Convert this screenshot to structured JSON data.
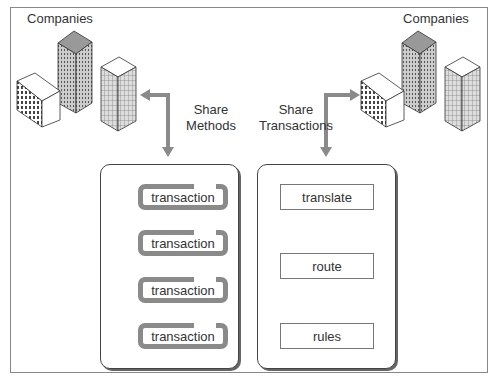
{
  "diagram": {
    "left_group": {
      "label": "Companies"
    },
    "right_group": {
      "label": "Companies"
    },
    "left_connector": {
      "label_line1": "Share",
      "label_line2": "Methods"
    },
    "right_connector": {
      "label_line1": "Share",
      "label_line2": "Transactions"
    },
    "left_panel": {
      "items": [
        {
          "label": "transaction"
        },
        {
          "label": "transaction"
        },
        {
          "label": "transaction"
        },
        {
          "label": "transaction"
        }
      ]
    },
    "right_panel": {
      "items": [
        {
          "label": "translate"
        },
        {
          "label": "route"
        },
        {
          "label": "rules"
        }
      ]
    },
    "colors": {
      "arrow": "#8a8a8a",
      "border": "#444444",
      "building_fill": "#bdbdbd"
    }
  }
}
